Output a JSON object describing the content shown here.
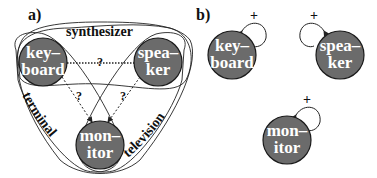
{
  "panel_a": {
    "label": "a)",
    "nodes": {
      "keyboard": {
        "line1": "key–",
        "line2": "board"
      },
      "speaker": {
        "line1": "spea–",
        "line2": "ker"
      },
      "monitor": {
        "line1": "mon–",
        "line2": "itor"
      }
    },
    "sets": {
      "top": "synthesizer",
      "left": "terminal",
      "right": "television"
    },
    "edge_labels": {
      "keyboard_speaker": "?",
      "keyboard_monitor": "?",
      "speaker_monitor": "?"
    }
  },
  "panel_b": {
    "label": "b)",
    "nodes": {
      "keyboard": {
        "line1": "key–",
        "line2": "board",
        "self_loop": "+"
      },
      "speaker": {
        "line1": "spea–",
        "line2": "ker",
        "self_loop": "+"
      },
      "monitor": {
        "line1": "mon–",
        "line2": "itor",
        "self_loop": "+"
      }
    }
  },
  "colors": {
    "node_fill": "#6b6b6b",
    "node_stroke": "#1a1a1a",
    "node_text": "#ffffff",
    "line": "#222222"
  }
}
